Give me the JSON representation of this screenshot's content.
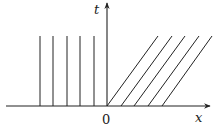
{
  "diagram": {
    "axes": {
      "x_label": "x",
      "y_label": "t",
      "origin_label": "0"
    },
    "origin_px": [
      107,
      106
    ],
    "colors": {
      "stroke": "#222222",
      "background": "#ffffff"
    },
    "vertical_lines_left": {
      "count": 5,
      "x_px": [
        40,
        53,
        67,
        80,
        94
      ],
      "y_top_px": 36,
      "y_bottom_px": 106
    },
    "diagonal_lines_right": {
      "count": 5,
      "bottom_x_px": [
        107,
        121,
        134,
        148,
        162
      ],
      "top_x_px": [
        158,
        172,
        185,
        199,
        212
      ],
      "y_top_px": 36,
      "y_bottom_px": 106
    }
  }
}
